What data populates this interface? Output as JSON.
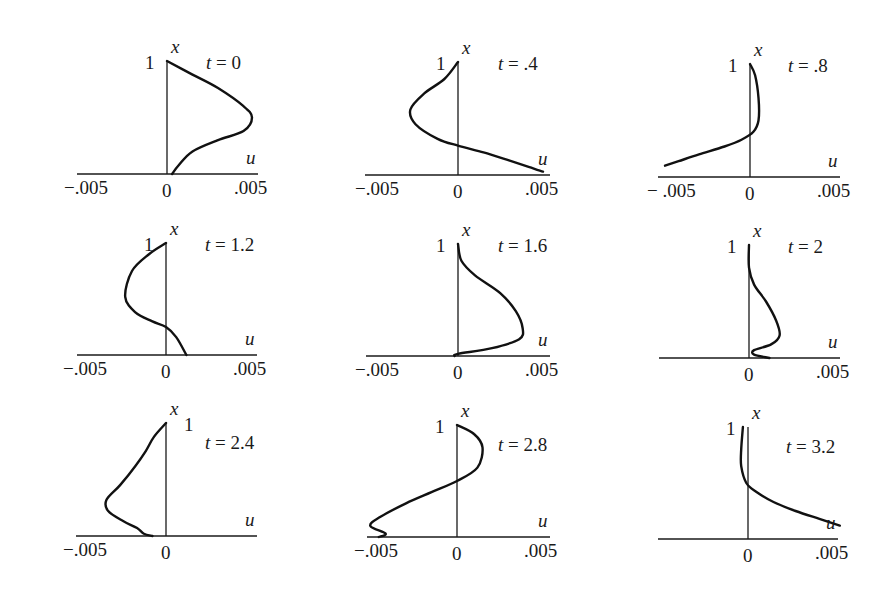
{
  "chart_data": {
    "type": "line",
    "title": "",
    "xlabel": "u",
    "ylabel": "x",
    "layout": "3x3 small multiples",
    "u_range": [
      -0.005,
      0.005
    ],
    "x_range": [
      0,
      1
    ],
    "panels": [
      {
        "t_label": "t = 0",
        "t": 0,
        "origin": [
          167,
          174
        ],
        "axis_left": 77,
        "axis_right": 258,
        "top": 61,
        "tick_labels": [
          "-.005",
          "0",
          ".005"
        ],
        "one_label_side": "left",
        "points": [
          [
            0,
            1
          ],
          [
            0.0015,
            0.88
          ],
          [
            0.003,
            0.76
          ],
          [
            0.0045,
            0.6
          ],
          [
            0.005,
            0.5
          ],
          [
            0.0045,
            0.38
          ],
          [
            0.003,
            0.3
          ],
          [
            0.0015,
            0.2
          ],
          [
            0.0007,
            0.08
          ],
          [
            0.0003,
            0.0
          ]
        ]
      },
      {
        "t_label": "t = .4",
        "t": 0.4,
        "origin": [
          458,
          175
        ],
        "axis_left": 365,
        "axis_right": 550,
        "top": 62,
        "tick_labels": [
          "-.005",
          "0",
          ".005"
        ],
        "one_label_side": "left",
        "points": [
          [
            0,
            1
          ],
          [
            -0.0008,
            0.85
          ],
          [
            -0.002,
            0.72
          ],
          [
            -0.0028,
            0.58
          ],
          [
            -0.0025,
            0.45
          ],
          [
            -0.0012,
            0.32
          ],
          [
            0,
            0.26
          ],
          [
            0.0015,
            0.2
          ],
          [
            0.003,
            0.13
          ],
          [
            0.0042,
            0.07
          ],
          [
            0.005,
            0.03
          ]
        ]
      },
      {
        "t_label": "t = .8",
        "t": 0.8,
        "origin": [
          750,
          177
        ],
        "axis_left": 658,
        "axis_right": 840,
        "top": 64,
        "tick_labels": [
          "- .005",
          "0",
          ".005"
        ],
        "one_label_side": "left",
        "points": [
          [
            0,
            1
          ],
          [
            0.0003,
            0.9
          ],
          [
            0.0005,
            0.7
          ],
          [
            0.0005,
            0.5
          ],
          [
            0.0002,
            0.4
          ],
          [
            -0.0005,
            0.33
          ],
          [
            -0.0015,
            0.27
          ],
          [
            -0.003,
            0.2
          ],
          [
            -0.0042,
            0.14
          ],
          [
            -0.005,
            0.1
          ]
        ]
      },
      {
        "t_label": "t = 1.2",
        "t": 1.2,
        "origin": [
          166,
          355
        ],
        "axis_left": 77,
        "axis_right": 257,
        "top": 243,
        "tick_labels": [
          "-.005",
          "0",
          ".005"
        ],
        "one_label_side": "left",
        "points": [
          [
            0,
            1
          ],
          [
            -0.001,
            0.9
          ],
          [
            -0.002,
            0.75
          ],
          [
            -0.0024,
            0.52
          ],
          [
            -0.0018,
            0.38
          ],
          [
            -0.0008,
            0.3
          ],
          [
            0,
            0.25
          ],
          [
            0.0006,
            0.16
          ],
          [
            0.0012,
            0.0
          ]
        ]
      },
      {
        "t_label": "t = 1.6",
        "t": 1.6,
        "origin": [
          458,
          356
        ],
        "axis_left": 366,
        "axis_right": 550,
        "top": 244,
        "tick_labels": [
          "-.005",
          "0",
          ".005"
        ],
        "one_label_side": "left",
        "points": [
          [
            0,
            1
          ],
          [
            0.0002,
            0.85
          ],
          [
            0.001,
            0.72
          ],
          [
            0.0025,
            0.56
          ],
          [
            0.0034,
            0.4
          ],
          [
            0.0038,
            0.25
          ],
          [
            0.0036,
            0.15
          ],
          [
            0.002,
            0.07
          ],
          [
            0,
            0.02
          ],
          [
            -0.0002,
            0.0
          ]
        ]
      },
      {
        "t_label": "t = 2",
        "t": 2,
        "origin": [
          749,
          358
        ],
        "axis_left": 659,
        "axis_right": 840,
        "top": 245,
        "tick_labels": [
          "",
          "0",
          ".005"
        ],
        "one_label_side": "left",
        "points": [
          [
            0,
            1
          ],
          [
            0,
            0.8
          ],
          [
            0.0003,
            0.65
          ],
          [
            0.001,
            0.5
          ],
          [
            0.0016,
            0.33
          ],
          [
            0.0018,
            0.2
          ],
          [
            0.0013,
            0.12
          ],
          [
            0.0003,
            0.07
          ],
          [
            0.0003,
            0.03
          ],
          [
            0.0012,
            0.0
          ]
        ]
      },
      {
        "t_label": "t = 2.4",
        "t": 2.4,
        "origin": [
          166,
          536
        ],
        "axis_left": 76,
        "axis_right": 257,
        "top": 423,
        "tick_labels": [
          "-.005",
          "0",
          ""
        ],
        "one_label_side": "right",
        "points": [
          [
            0,
            1
          ],
          [
            -0.0007,
            0.88
          ],
          [
            -0.0012,
            0.75
          ],
          [
            -0.0018,
            0.62
          ],
          [
            -0.0027,
            0.45
          ],
          [
            -0.0035,
            0.32
          ],
          [
            -0.0034,
            0.22
          ],
          [
            -0.0025,
            0.13
          ],
          [
            -0.0017,
            0.07
          ],
          [
            -0.0013,
            0.02
          ],
          [
            -0.0008,
            0.0
          ]
        ]
      },
      {
        "t_label": "t = 2.8",
        "t": 2.8,
        "origin": [
          457,
          537
        ],
        "axis_left": 367,
        "axis_right": 550,
        "top": 425,
        "tick_labels": [
          "-.005",
          "0",
          ".005"
        ],
        "one_label_side": "left",
        "points": [
          [
            0,
            1
          ],
          [
            0.001,
            0.92
          ],
          [
            0.0015,
            0.8
          ],
          [
            0.0012,
            0.62
          ],
          [
            0,
            0.5
          ],
          [
            -0.0015,
            0.4
          ],
          [
            -0.003,
            0.3
          ],
          [
            -0.0045,
            0.18
          ],
          [
            -0.0051,
            0.1
          ],
          [
            -0.0042,
            0.03
          ],
          [
            -0.0046,
            0.0
          ]
        ]
      },
      {
        "t_label": "t = 3.2",
        "t": 3.2,
        "origin": [
          748,
          539
        ],
        "axis_left": 658,
        "axis_right": 838,
        "top": 427,
        "tick_labels": [
          "",
          "0",
          ".005"
        ],
        "one_label_side": "left",
        "points": [
          [
            -0.0003,
            1
          ],
          [
            -0.0004,
            0.8
          ],
          [
            -0.0004,
            0.65
          ],
          [
            -0.0001,
            0.5
          ],
          [
            0.0005,
            0.42
          ],
          [
            0.0015,
            0.33
          ],
          [
            0.0028,
            0.25
          ],
          [
            0.0042,
            0.18
          ],
          [
            0.0054,
            0.12
          ]
        ]
      }
    ]
  },
  "labels": {
    "axis_x": "x",
    "axis_u": "u",
    "one": "1"
  }
}
